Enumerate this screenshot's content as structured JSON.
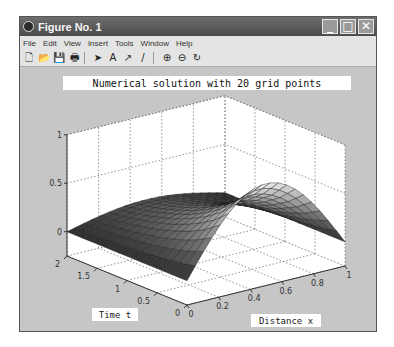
{
  "window": {
    "title": "Figure No. 1",
    "controls": {
      "minimize": "_",
      "maximize": "□",
      "close": "✕"
    }
  },
  "menubar": {
    "items": [
      "File",
      "Edit",
      "View",
      "Insert",
      "Tools",
      "Window",
      "Help"
    ]
  },
  "toolbar": {
    "groups": [
      [
        {
          "name": "new-figure-icon",
          "glyph": "🗋"
        },
        {
          "name": "open-icon",
          "glyph": "📂"
        },
        {
          "name": "save-icon",
          "glyph": "💾"
        },
        {
          "name": "print-icon",
          "glyph": "🖶"
        }
      ],
      [
        {
          "name": "select-arrow-icon",
          "glyph": "➤"
        },
        {
          "name": "insert-text-icon",
          "glyph": "A"
        },
        {
          "name": "insert-arrow-icon",
          "glyph": "↗"
        },
        {
          "name": "insert-line-icon",
          "glyph": "/"
        }
      ],
      [
        {
          "name": "zoom-in-icon",
          "glyph": "⊕"
        },
        {
          "name": "zoom-out-icon",
          "glyph": "⊖"
        },
        {
          "name": "rotate-3d-icon",
          "glyph": "↻"
        }
      ]
    ]
  },
  "colors": {
    "figure_bg": "#c6c6c6",
    "axes_bg": "#ffffff",
    "surface_dark": "#2b2b2b",
    "surface_light": "#e8e8e8",
    "titlebar": "#5a5a5a"
  },
  "chart_data": {
    "type": "surface3d",
    "title": "Numerical solution with 20 grid points",
    "xlabel": "Distance x",
    "ylabel": "Time t",
    "zlabel": "",
    "xlim": [
      0,
      1
    ],
    "ylim": [
      0,
      2
    ],
    "zlim": [
      0,
      1
    ],
    "xticks": [
      "0",
      "0.2",
      "0.4",
      "0.6",
      "0.8",
      "1"
    ],
    "yticks": [
      "0",
      "0.5",
      "1",
      "1.5",
      "2"
    ],
    "zticks": [
      "0",
      "0.5",
      "1"
    ],
    "grid": true,
    "colormap": "gray",
    "x": [
      0,
      0.1,
      0.2,
      0.3,
      0.4,
      0.5,
      0.6,
      0.7,
      0.8,
      0.9,
      1.0
    ],
    "t": [
      0,
      0.25,
      0.5,
      0.75,
      1.0,
      1.25,
      1.5,
      1.75,
      2.0
    ],
    "u_peak_by_t": [
      0.8,
      0.62,
      0.49,
      0.39,
      0.31,
      0.25,
      0.2,
      0.16,
      0.13
    ]
  }
}
